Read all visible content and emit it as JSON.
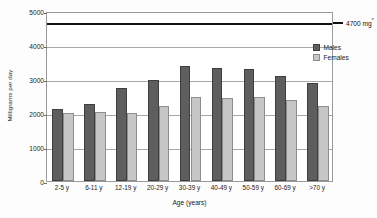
{
  "chart_data": {
    "type": "bar",
    "title": "",
    "xlabel": "Age (years)",
    "ylabel": "Milligrams per day",
    "categories": [
      "2-5 y",
      "6-11 y",
      "12-19 y",
      "20-29 y",
      "30-39 y",
      "40-49 y",
      "50-59 y",
      "60-69 y",
      ">70 y"
    ],
    "series": [
      {
        "name": "Males",
        "color": "#5e5e5e",
        "values": [
          2110,
          2270,
          2750,
          2970,
          3370,
          3310,
          3290,
          3080,
          2880
        ]
      },
      {
        "name": "Females",
        "color": "#c6c6c6",
        "values": [
          2010,
          2040,
          2000,
          2220,
          2460,
          2450,
          2460,
          2390,
          2220
        ]
      }
    ],
    "ylim": [
      0,
      5000
    ],
    "yticks": [
      0,
      1000,
      2000,
      3000,
      4000,
      5000
    ],
    "ytick_labels": [
      "0",
      "1000",
      "2000",
      "3000",
      "4000",
      "5000"
    ],
    "grid": true,
    "legend_position": "right",
    "annotations": [
      {
        "name": "reference-line",
        "value": 4700,
        "label": "4700 mg",
        "superscript": "*",
        "color": "#111111"
      }
    ]
  }
}
